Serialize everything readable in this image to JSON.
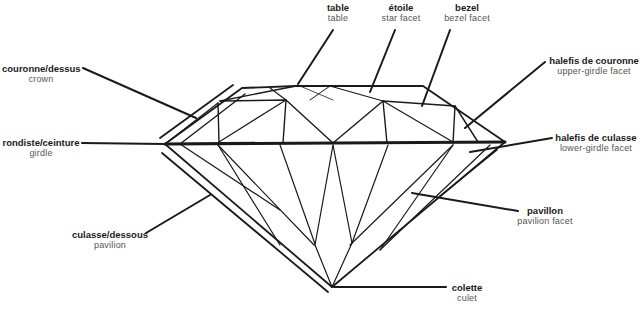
{
  "labels": {
    "table": {
      "fr": "table",
      "en": "table"
    },
    "star": {
      "fr": "étoile",
      "en": "star  facet"
    },
    "bezel": {
      "fr": "bezel",
      "en": "bezel  facet"
    },
    "crown": {
      "fr": "couronne/dessus",
      "en": "crown"
    },
    "upper_girdle": {
      "fr": "halefis  de  couronne",
      "en": "upper-girdle  facet"
    },
    "girdle": {
      "fr": "rondiste/ceinture",
      "en": "girdle"
    },
    "lower_girdle": {
      "fr": "halefis  de  culasse",
      "en": "lower-girdle  facet"
    },
    "pavilion_facet": {
      "fr": "pavillon",
      "en": "pavilion  facet"
    },
    "pavilion": {
      "fr": "culasse/dessous",
      "en": "pavilion"
    },
    "culet": {
      "fr": "colette",
      "en": "culet"
    }
  },
  "colors": {
    "line": "#1a1a1a",
    "fr_text": "#1a1a1a",
    "en_text": "#555555"
  }
}
